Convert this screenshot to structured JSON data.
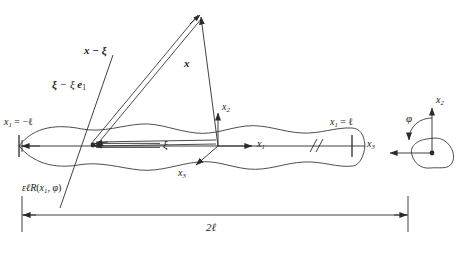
{
  "figure": {
    "stroke_color": "#2b2b2b",
    "background": "#ffffff"
  },
  "labels": {
    "x_minus_xi": "x − ξ",
    "xi_minus_xi_e1_bold": "ξ",
    "xi_minus_xi_e1_rest": " − ξ ",
    "xi_minus_xi_e1_e": "e",
    "xi_minus_xi_e1_sub": "1",
    "x_vector": "x",
    "x1_left_name": "x",
    "x1_left_sub": "1",
    "x1_left_value": " = −ℓ",
    "x1_right_name": "x",
    "x1_right_sub": "1",
    "x1_right_value": " = ℓ",
    "xi_center": "ξ",
    "axis_x1": "x",
    "axis_x1_sub": "1",
    "axis_x2": "x",
    "axis_x2_sub": "2",
    "axis_x3": "x",
    "axis_x3_sub": "3",
    "radius_eps": "ε",
    "radius_ell": "ℓ",
    "radius_R": "R",
    "radius_arg_open": "(",
    "radius_arg_x": "x",
    "radius_arg_sub": "1",
    "radius_arg_comma": ", ",
    "radius_arg_phi": "φ",
    "radius_arg_close": ")",
    "length_dim": "2ℓ",
    "inset_x2": "x",
    "inset_x2_sub": "2",
    "inset_x3": "x",
    "inset_x3_sub": "3",
    "inset_phi": "φ"
  },
  "geometry": {
    "axis_y": 146,
    "axis_left_x": 18,
    "axis_right_x": 365,
    "origin_x": 218,
    "apex_x": 200,
    "apex_y": 14,
    "foot_x": 93,
    "foot_y": 145,
    "dim_y": 215,
    "dim_left_x": 22,
    "dim_right_x": 408,
    "inset_cx": 432,
    "inset_cy": 148
  }
}
